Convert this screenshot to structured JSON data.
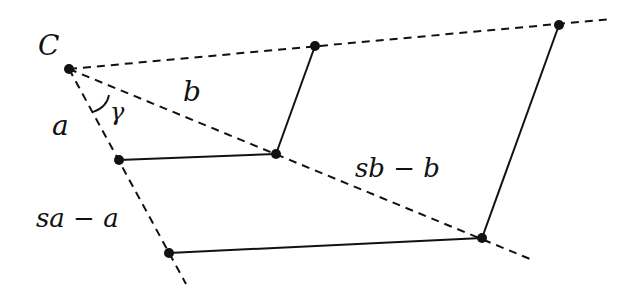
{
  "diagram": {
    "colors": {
      "line": "#111111",
      "background": "#ffffff"
    },
    "labels": {
      "vertex": "C",
      "angle": "γ",
      "side_a": "a",
      "side_b": "b",
      "ext_a": "sa − a",
      "ext_b": "sb − b"
    },
    "points": {
      "C": [
        69,
        69
      ],
      "top_1": [
        315,
        46
      ],
      "top_2": [
        559,
        25
      ],
      "b_1": [
        276,
        154
      ],
      "b_2": [
        482,
        238
      ],
      "a_1": [
        119,
        160
      ],
      "a_2": [
        169,
        253
      ]
    },
    "dashed_rays": [
      {
        "name": "ray-top",
        "from": [
          69,
          69
        ],
        "to": [
          612,
          19
        ]
      },
      {
        "name": "ray-b",
        "from": [
          69,
          69
        ],
        "to": [
          530,
          259
        ]
      },
      {
        "name": "ray-a",
        "from": [
          69,
          69
        ],
        "to": [
          186,
          284
        ]
      }
    ],
    "solid_segments": [
      {
        "name": "segment-a1-b1",
        "from": [
          119,
          160
        ],
        "to": [
          276,
          154
        ]
      },
      {
        "name": "segment-b1-top1",
        "from": [
          276,
          154
        ],
        "to": [
          315,
          46
        ]
      },
      {
        "name": "segment-a2-b2",
        "from": [
          169,
          253
        ],
        "to": [
          482,
          238
        ]
      },
      {
        "name": "segment-b2-top2",
        "from": [
          482,
          238
        ],
        "to": [
          559,
          25
        ]
      }
    ]
  }
}
